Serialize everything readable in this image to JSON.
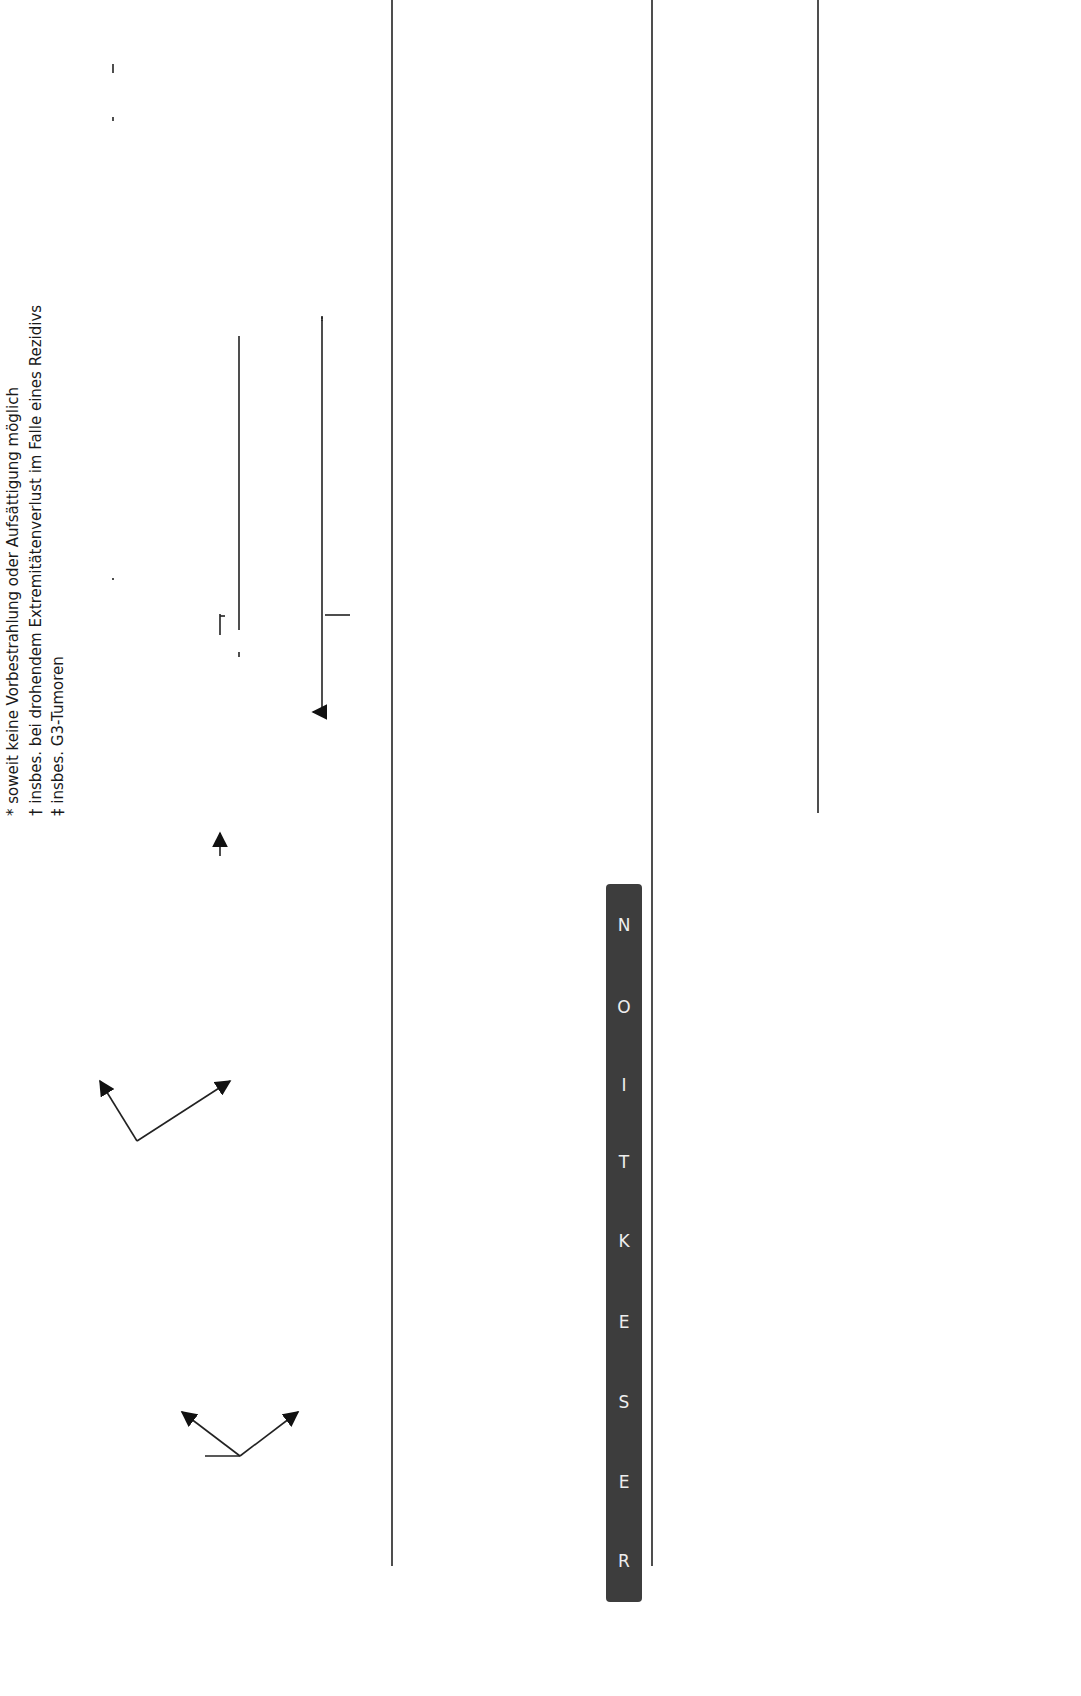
{
  "footnotes": [
    "* soweit keine Vorbestrahlung oder Aufsättigung möglich",
    "† insbes. bei drohendem Extremitätenverlust im Falle eines Rezidivs",
    "‡ insbes. G3-Tumoren"
  ],
  "resection_bar": {
    "letters": [
      "R",
      "E",
      "S",
      "E",
      "K",
      "T",
      "I",
      "O",
      "N"
    ],
    "color": "#3d3d3d"
  },
  "lane1": {
    "stage": {
      "T": "T",
      "T_sub": "1–2",
      "G": "G",
      "G_sub": "1–2",
      "M": "M",
      "M_sub": "0"
    },
    "r0_sicher": {
      "line1": "R0-Resektabilität",
      "line2": "sicher gegeben",
      "line3": "(insbes. T",
      "t1": "1a",
      "slash": "/T",
      "t2": "2a",
      ")": ")"
    },
    "r0_fraglich": {
      "line1": "R0-Resektabilität",
      "line2": "fraglich",
      "line3": "(insbes. T",
      "t": "2b",
      "close": ")"
    },
    "ohne": {
      "line1": "Ohne",
      "line2": "Funktionsverlust"
    },
    "nur": {
      "line1": "Nur",
      "line2": "unter relevantem",
      "line3": "Funktionsverlust"
    },
    "praeop": {
      "line1": "Präoperative",
      "line2": "Radiotherapie (RT)",
      "line3": "± oder Extremitäten-",
      "line4": "perfusion"
    },
    "tags": [
      "R0",
      "R1",
      "R2"
    ],
    "r1_box": {
      "line1": "Nachresektion +",
      "line2": "postoperative RT*†",
      "line3": "(ggf. kombiniert mit",
      "line4": "IORT oder",
      "line5": "Afterloading)"
    },
    "r2_box": {
      "line1": "Postoperative RT*,",
      "line2": "Nachresektion bzw.",
      "line3": "Amputation"
    },
    "nachsorge": "Nachsorge"
  },
  "lane2": {
    "stage": {
      "T": "T",
      "T_sub": "1–2",
      "G": "G",
      "G_sub": "2/3",
      "M": "M",
      "M_sub": "0"
    },
    "r0_sicher": {
      "line1": "R0-Resektion",
      "line2": "sicher möglich"
    },
    "r0_fraglich": {
      "line1": "R0-Resektabilität",
      "line2": "fraglich"
    },
    "praeop": {
      "line1": "Präoperative RT",
      "line2": "± Chemotherapie oder",
      "line3": "Extremitätenperfusion"
    },
    "tags": [
      "R0",
      "R1",
      "R2"
    ],
    "adjuvant": {
      "line1": "Adjuvante",
      "line2": "Chemotherapie ‡"
    },
    "r1_box": {
      "line1": "Nachresektion",
      "line2": "oder RT*"
    },
    "r2_box": {
      "line1": "RT* ±",
      "line2": "Nachresektion",
      "line3": "bzw. Amputation"
    },
    "additive": {
      "line1": "Additive",
      "line2": "Chemotherapie"
    },
    "nachsorge": "Nachsorge"
  },
  "lane3": {
    "stage": {
      "T": "T",
      "T_sub": "x",
      "M": "M",
      "M_sub": "1"
    },
    "induktion": {
      "line1": "Induktions-",
      "line2": "chemotherapie"
    },
    "ansprechen": {
      "line1": "Bei Ansprechen: Tumorresektion,",
      "line2": "wenn R0 erreichbar"
    },
    "nicht_gegeben": "R0-Resektabilität nicht gegeben",
    "progress": {
      "line1": "Progress unter Induktions-",
      "line2": "chemotherapie"
    },
    "tags": [
      "R0",
      "R1"
    ],
    "metastasen": {
      "line1": "Metastasen-",
      "line2": "resektion"
    },
    "lokale": {
      "line1": "Lokale RT und",
      "line2": "Metastasen-",
      "line3": "resektion"
    },
    "ggf_additive": {
      "line1": "Ggf. additive",
      "line2": "Chemotherapie"
    },
    "nachsorge": "Nachsorge",
    "fortsetzung": {
      "line1": "Fortsetzung der Chemotherapie ± RT",
      "line2": "bis Progress"
    },
    "palliative": "Palliative Second-Line-Chemotherapie"
  }
}
